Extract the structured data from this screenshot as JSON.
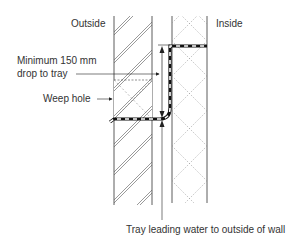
{
  "labels": {
    "outside": "Outside",
    "inside": "Inside",
    "min_drop_line1": "Minimum 150 mm",
    "min_drop_line2": "drop to tray",
    "weep_hole": "Weep hole",
    "tray_caption": "Tray leading water to outside of wall"
  },
  "colors": {
    "line": "#333333",
    "hatch": "#555555",
    "block_pattern": "#9a9a9a",
    "tray": "#111111",
    "background": "#ffffff"
  }
}
